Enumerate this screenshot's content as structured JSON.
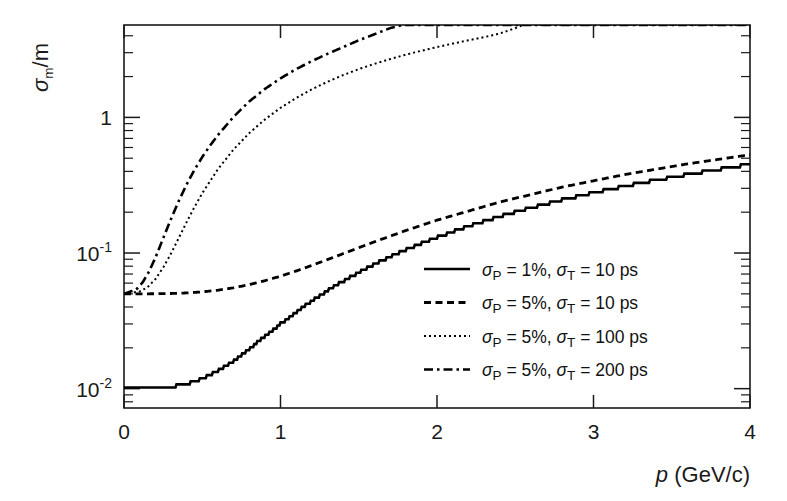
{
  "figure": {
    "y_axis_title": "σ_m/m",
    "x_axis_title": "p (GeV/c)",
    "background": "#ffffff",
    "line_color": "#000000"
  },
  "axis": {
    "x_ticks": [
      "0",
      "1",
      "2",
      "3",
      "4"
    ],
    "y_ticks": [
      "10-2",
      "10-1",
      "1"
    ],
    "y_tick_labels": [
      {
        "base": "10",
        "exp": "-2"
      },
      {
        "base": "10",
        "exp": "-1"
      },
      {
        "base": "1",
        "exp": ""
      }
    ]
  },
  "legend": {
    "entries": [
      {
        "style": "solid",
        "sigma_p": "1%",
        "sigma_t": "10 ps",
        "label": "σP = 1%,  σT = 10 ps"
      },
      {
        "style": "dashed",
        "sigma_p": "5%",
        "sigma_t": "10 ps",
        "label": "σP = 5%,  σT = 10 ps"
      },
      {
        "style": "dotted",
        "sigma_p": "5%",
        "sigma_t": "100 ps",
        "label": "σP = 5%,  σT = 100 ps"
      },
      {
        "style": "dashdot",
        "sigma_p": "5%",
        "sigma_t": "200 ps",
        "label": "σP = 5%,  σT = 200 ps"
      }
    ]
  },
  "chart_data": {
    "type": "line",
    "title": "",
    "xlabel": "p (GeV/c)",
    "ylabel": "sigma_m / m",
    "xscale": "linear",
    "yscale": "log",
    "xlim": [
      0,
      4
    ],
    "ylim": [
      0.0072,
      4.8
    ],
    "grid": false,
    "legend_position": "center-right",
    "x_ticks": [
      0,
      1,
      2,
      3,
      4
    ],
    "y_ticks": [
      0.01,
      0.1,
      1
    ],
    "series": [
      {
        "name": "σP = 1%, σT = 10 ps",
        "style": "solid",
        "x": [
          0.0,
          0.1,
          0.2,
          0.3,
          0.4,
          0.5,
          0.6,
          0.7,
          0.8,
          0.9,
          1.0,
          1.1,
          1.2,
          1.3,
          1.4,
          1.5,
          1.6,
          1.7,
          1.8,
          1.9,
          2.0,
          2.2,
          2.4,
          2.6,
          2.8,
          3.0,
          3.2,
          3.4,
          3.6,
          3.8,
          4.0
        ],
        "y": [
          0.01,
          0.01,
          0.0101,
          0.0103,
          0.0108,
          0.0118,
          0.0135,
          0.016,
          0.0196,
          0.0243,
          0.03,
          0.0367,
          0.0443,
          0.0528,
          0.062,
          0.072,
          0.0826,
          0.0938,
          0.1056,
          0.1179,
          0.1307,
          0.1575,
          0.1858,
          0.2155,
          0.2463,
          0.2783,
          0.3111,
          0.3448,
          0.3793,
          0.4143,
          0.45
        ]
      },
      {
        "name": "σP = 5%, σT = 10 ps",
        "style": "dashed",
        "x": [
          0.0,
          0.1,
          0.2,
          0.3,
          0.4,
          0.5,
          0.6,
          0.7,
          0.8,
          0.9,
          1.0,
          1.1,
          1.2,
          1.3,
          1.4,
          1.5,
          1.6,
          1.8,
          2.0,
          2.4,
          2.8,
          3.2,
          3.6,
          4.0
        ],
        "y": [
          0.05,
          0.05,
          0.0501,
          0.0503,
          0.0508,
          0.0517,
          0.0532,
          0.0554,
          0.0585,
          0.0625,
          0.0675,
          0.0737,
          0.081,
          0.0894,
          0.0989,
          0.1094,
          0.1209,
          0.1464,
          0.1747,
          0.2375,
          0.3063,
          0.379,
          0.4541,
          0.5305
        ]
      },
      {
        "name": "σP = 5%, σT = 100 ps",
        "style": "dotted",
        "x": [
          0.0,
          0.1,
          0.15,
          0.2,
          0.25,
          0.3,
          0.35,
          0.4,
          0.45,
          0.5,
          0.6,
          0.7,
          0.8,
          0.9,
          1.0,
          1.1,
          1.2,
          1.3,
          1.4,
          1.5,
          1.6,
          1.7,
          1.8,
          1.9,
          2.0,
          2.1,
          2.2,
          2.3,
          2.4,
          2.5,
          2.55,
          4.0
        ],
        "y": [
          0.05,
          0.052,
          0.056,
          0.064,
          0.078,
          0.099,
          0.129,
          0.169,
          0.218,
          0.276,
          0.415,
          0.58,
          0.765,
          0.965,
          1.175,
          1.39,
          1.61,
          1.83,
          2.05,
          2.27,
          2.48,
          2.69,
          2.9,
          3.1,
          3.3,
          3.5,
          3.7,
          3.9,
          4.15,
          4.55,
          4.8,
          4.8
        ]
      },
      {
        "name": "σP = 5%, σT = 200 ps",
        "style": "dashdot",
        "x": [
          0.0,
          0.08,
          0.12,
          0.16,
          0.2,
          0.25,
          0.3,
          0.35,
          0.4,
          0.45,
          0.5,
          0.55,
          0.6,
          0.7,
          0.8,
          0.9,
          1.0,
          1.1,
          1.2,
          1.3,
          1.4,
          1.5,
          1.6,
          1.7,
          1.78,
          4.0
        ],
        "y": [
          0.05,
          0.054,
          0.061,
          0.073,
          0.092,
          0.128,
          0.178,
          0.242,
          0.32,
          0.41,
          0.51,
          0.62,
          0.74,
          1.01,
          1.31,
          1.62,
          1.94,
          2.27,
          2.6,
          2.94,
          3.3,
          3.7,
          4.1,
          4.55,
          4.8,
          4.8
        ]
      }
    ]
  }
}
